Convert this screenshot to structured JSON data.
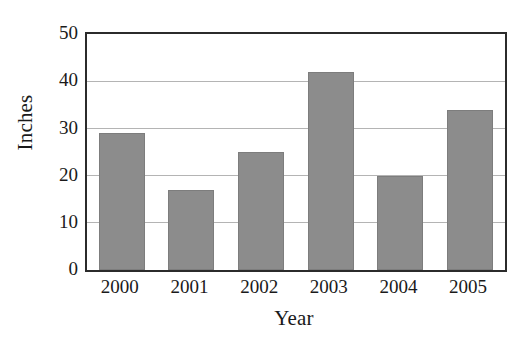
{
  "chart_data": {
    "type": "bar",
    "title": "",
    "subtitle": "",
    "xlabel": "Year",
    "ylabel": "Inches",
    "categories": [
      "2000",
      "2001",
      "2002",
      "2003",
      "2004",
      "2005"
    ],
    "values": [
      29,
      17,
      25,
      42,
      20,
      34
    ],
    "series": [
      {
        "name": "Inches",
        "values": [
          29,
          17,
          25,
          42,
          20,
          34
        ]
      }
    ],
    "ylim": [
      0,
      50
    ],
    "yticks": [
      0,
      10,
      20,
      30,
      40,
      50
    ],
    "ytick_labels": [
      "0",
      "10",
      "20",
      "30",
      "40",
      "50"
    ],
    "grid": {
      "horizontal": true,
      "vertical": false,
      "color": "#b4b4b4"
    },
    "legend": {
      "visible": false,
      "position": "none",
      "entries": []
    },
    "annotations": [],
    "colors": {
      "bar_fill": "#8c8c8c",
      "bar_edge": "#7d7d7d",
      "axis": "#2b2b2b",
      "gridline": "#b4b4b4",
      "text": "#1a1a1a",
      "background": "#ffffff"
    }
  }
}
